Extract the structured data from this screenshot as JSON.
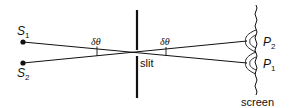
{
  "diagram": {
    "type": "single-slit diffraction / resolution of two sources",
    "sources": [
      {
        "id": "S1",
        "label": "S",
        "sub": "1",
        "x": 23,
        "y": 42
      },
      {
        "id": "S2",
        "label": "S",
        "sub": "2",
        "x": 23,
        "y": 63
      }
    ],
    "slit": {
      "label": "slit",
      "x": 137,
      "top": 10,
      "gap_top": 50,
      "gap_bottom": 55,
      "bottom": 98
    },
    "screen": {
      "label": "screen",
      "x": 257,
      "top": 5,
      "bottom": 95
    },
    "points": [
      {
        "id": "P2",
        "label": "P",
        "sub": "2",
        "x": 247,
        "y": 41
      },
      {
        "id": "P1",
        "label": "P",
        "sub": "1",
        "x": 247,
        "y": 63
      }
    ],
    "angles": [
      {
        "label": "δθ",
        "side": "left"
      },
      {
        "label": "δθ",
        "side": "right"
      }
    ],
    "colors": {
      "line": "#111111",
      "background": "#ffffff"
    }
  }
}
